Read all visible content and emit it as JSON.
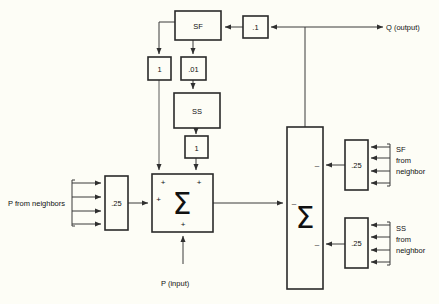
{
  "figure": {
    "background_color": "#fdfdf6",
    "line_color": "#3a3a3a",
    "box_border_color": "#2a2a2a"
  },
  "blocks": {
    "sf": {
      "label": "SF"
    },
    "ss": {
      "label": "SS"
    },
    "gain_point_one": {
      "label": ".1"
    },
    "gain_one_left": {
      "label": "1"
    },
    "gain_point_zero_one": {
      "label": ".01"
    },
    "gain_one_lower": {
      "label": "1"
    },
    "gain_quarter_p": {
      "label": ".25"
    },
    "gain_quarter_sf": {
      "label": ".25"
    },
    "gain_quarter_ss": {
      "label": ".25"
    },
    "summer_left": {
      "label": "Σ"
    },
    "summer_right": {
      "label": "Σ"
    }
  },
  "signs": {
    "left_summer_top_left": "+",
    "left_summer_top_right": "+",
    "left_summer_left": "+",
    "left_summer_bottom": "+",
    "right_summer_sf_input": "–",
    "right_summer_main_input": "–",
    "right_summer_ss_input": "–"
  },
  "labels": {
    "output": "Q (output)",
    "p_from_neighbors": "P from neighbors",
    "p_input": "P (input)",
    "sf_from_neighbor": "SF\nfrom\nneighbor",
    "sf_from_neighbor_line1": "SF",
    "sf_from_neighbor_line2": "from",
    "sf_from_neighbor_line3": "neighbor",
    "ss_from_neighbor_line1": "SS",
    "ss_from_neighbor_line2": "from",
    "ss_from_neighbor_line3": "neighbor"
  }
}
